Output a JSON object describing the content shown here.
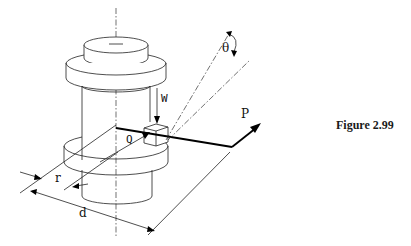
{
  "figure": {
    "caption": "Figure 2.99",
    "labels": {
      "W": "W",
      "Q": "Q",
      "P": "P",
      "theta": "θ",
      "r": "r",
      "d": "d"
    }
  }
}
